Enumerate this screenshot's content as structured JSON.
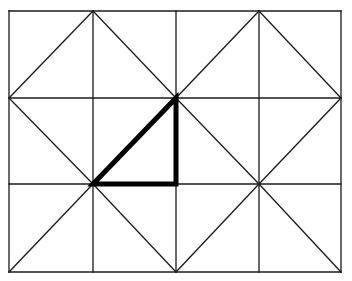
{
  "diagram": {
    "grid": {
      "columns": 4,
      "rows": 3,
      "x_lines": [
        9,
        93,
        176,
        259,
        341
      ],
      "y_lines": [
        11,
        98,
        184,
        272
      ]
    },
    "line_color": "#1a1a1a",
    "highlight_color": "#000000",
    "thin_stroke": 1.3,
    "thick_stroke": 5,
    "diagonals": [
      [
        9,
        98,
        93,
        11
      ],
      [
        93,
        11,
        176,
        98
      ],
      [
        176,
        98,
        259,
        11
      ],
      [
        259,
        11,
        341,
        98
      ],
      [
        9,
        98,
        93,
        184
      ],
      [
        176,
        98,
        93,
        184
      ],
      [
        176,
        98,
        259,
        184
      ],
      [
        341,
        98,
        259,
        184
      ],
      [
        9,
        272,
        93,
        184
      ],
      [
        93,
        184,
        176,
        272
      ],
      [
        176,
        272,
        259,
        184
      ],
      [
        259,
        184,
        341,
        272
      ]
    ],
    "highlighted_triangle": {
      "vertices": [
        [
          176,
          98
        ],
        [
          176,
          184
        ],
        [
          93,
          184
        ]
      ]
    }
  }
}
